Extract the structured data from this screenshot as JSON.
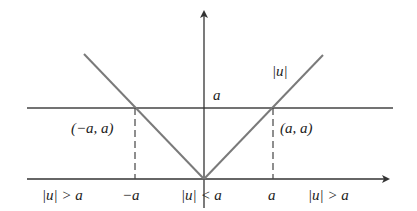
{
  "diagram": {
    "colors": {
      "axis": "#333333",
      "curve": "#7a7a7a",
      "guide": "#444444",
      "text": "#222222"
    },
    "curve_label": "|u|",
    "level_label": "a",
    "points": [
      {
        "name": "left-intersection",
        "label": "(−a, a)"
      },
      {
        "name": "right-intersection",
        "label": "(a, a)"
      }
    ],
    "x_axis_labels": [
      {
        "name": "left-region",
        "text": "|u| > a"
      },
      {
        "name": "neg-a-tick",
        "text": "−a"
      },
      {
        "name": "center-region",
        "text": "|u| < a"
      },
      {
        "name": "pos-a-tick",
        "text": "a"
      },
      {
        "name": "right-region",
        "text": "|u| > a"
      }
    ]
  }
}
